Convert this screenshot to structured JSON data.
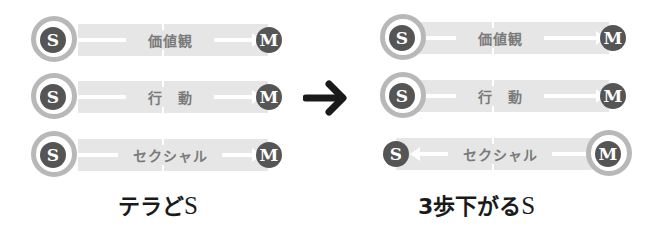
{
  "colors": {
    "bar": "#e6e6e6",
    "ring": "#b8b8b8",
    "dot": "#555555",
    "label": "#7a7a7a",
    "arrow": "#1a1a1a"
  },
  "before": {
    "caption": "テラどS",
    "caption_main": "テラど",
    "caption_s": "S",
    "rows": [
      {
        "label": "価値観",
        "left": "S",
        "right": "M",
        "direction": "right",
        "ring": "S"
      },
      {
        "label": "行　動",
        "left": "S",
        "right": "M",
        "direction": "right",
        "ring": "S"
      },
      {
        "label": "セクシャル",
        "left": "S",
        "right": "M",
        "direction": "right",
        "ring": "S"
      }
    ]
  },
  "transition_arrow": "right-arrow",
  "after": {
    "caption": "3歩下がるS",
    "caption_main": "3歩下がる",
    "caption_s": "S",
    "rows": [
      {
        "label": "価値観",
        "left": "S",
        "right": "M",
        "direction": "right",
        "ring": "S"
      },
      {
        "label": "行　動",
        "left": "S",
        "right": "M",
        "direction": "right",
        "ring": "S"
      },
      {
        "label": "セクシャル",
        "left": "S",
        "right": "M",
        "direction": "left",
        "ring": "M"
      }
    ]
  }
}
